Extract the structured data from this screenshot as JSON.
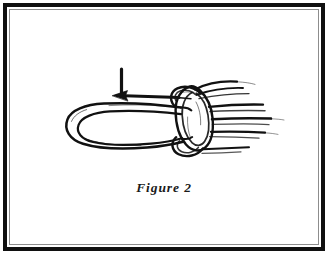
{
  "figure": {
    "caption": "Figure 2",
    "media": "black and white scanned line art",
    "background_color": "#ffffff",
    "ink_color": "#111111"
  },
  "frame": {
    "style": "double-ruled-rectangle",
    "outer_rule_color": "#101010",
    "outer_rule_width_px": 4,
    "inner_rule_color": "#8d8d8d",
    "inner_rule_width_px": 1
  },
  "annotations": {
    "arrow": {
      "name": "direction-of-pull-arrow",
      "shape": "L-shaped leader with left-pointing arrowhead",
      "points_toward": "left"
    }
  },
  "elements": {
    "loop_label": "rope-bight-loop",
    "knot_label": "knot-body",
    "strands_label": "standing-rope-strands"
  }
}
